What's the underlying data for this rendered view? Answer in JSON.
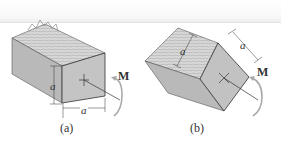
{
  "figure": {
    "panels": [
      {
        "id": "a",
        "caption": "(a)",
        "dimension_vertical": "a",
        "dimension_horizontal": "a",
        "moment_label": "M"
      },
      {
        "id": "b",
        "caption": "(b)",
        "dimension_left": "a",
        "dimension_right": "a",
        "moment_label": "M"
      }
    ]
  }
}
